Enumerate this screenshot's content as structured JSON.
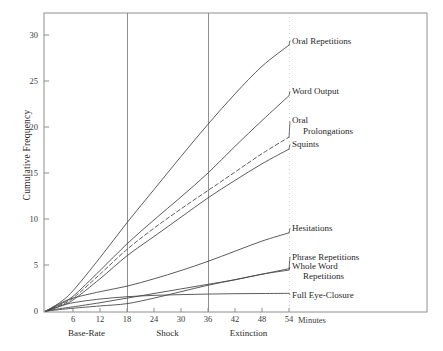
{
  "chart_data": {
    "type": "line",
    "title": "",
    "xlabel": "Minutes",
    "ylabel": "Cumulative Frequency",
    "xlim": [
      0,
      58
    ],
    "ylim": [
      0,
      32
    ],
    "xticks": [
      0,
      6,
      12,
      18,
      24,
      30,
      36,
      42,
      48,
      54
    ],
    "yticks": [
      0,
      5,
      10,
      15,
      20,
      25,
      30
    ],
    "grid": false,
    "vertical_dividers": [
      18,
      36
    ],
    "legend_position": "right-inline-labels",
    "phases": [
      {
        "label": "Base-Rate",
        "start": 0,
        "end": 18,
        "center": 9
      },
      {
        "label": "Shock",
        "start": 18,
        "end": 36,
        "center": 27
      },
      {
        "label": "Extinction",
        "start": 36,
        "end": 54,
        "center": 45
      }
    ],
    "x": [
      0,
      3,
      6,
      12,
      18,
      24,
      30,
      36,
      42,
      48,
      54
    ],
    "series": [
      {
        "name": "Oral Repetitions",
        "style": "solid",
        "values": [
          0,
          0.9,
          2.2,
          5.8,
          9.6,
          13.2,
          16.8,
          20.3,
          23.6,
          26.6,
          28.9
        ],
        "label_y": 29.4
      },
      {
        "name": "Word Output",
        "style": "solid",
        "values": [
          0,
          0.7,
          1.6,
          4.4,
          7.3,
          9.9,
          12.4,
          15.0,
          17.9,
          20.7,
          23.4
        ],
        "label_y": 23.9
      },
      {
        "name": "Oral Prolongations",
        "style": "dashed",
        "values": [
          0,
          0.6,
          1.4,
          4.0,
          6.7,
          9.0,
          11.1,
          13.1,
          15.1,
          17.1,
          18.9
        ],
        "label_y": 20.6
      },
      {
        "name": "Squints",
        "style": "solid",
        "values": [
          0,
          0.5,
          1.2,
          3.5,
          6.0,
          8.1,
          10.2,
          12.3,
          14.2,
          16.0,
          17.6
        ],
        "label_y": 18.1
      },
      {
        "name": "Hesitations",
        "style": "solid",
        "values": [
          0,
          0.8,
          1.4,
          2.1,
          2.7,
          3.5,
          4.4,
          5.4,
          6.5,
          7.6,
          8.5
        ],
        "label_y": 9.0
      },
      {
        "name": "Phrase Repetitions",
        "style": "solid",
        "values": [
          0,
          0.25,
          0.45,
          0.9,
          1.4,
          1.9,
          2.4,
          2.9,
          3.4,
          4.0,
          4.6
        ],
        "label_y": 5.9
      },
      {
        "name": "Whole Word Repetitions",
        "style": "solid",
        "values": [
          0,
          0.15,
          0.3,
          0.55,
          0.8,
          1.4,
          2.1,
          2.8,
          3.4,
          4.0,
          4.45
        ],
        "label_y": 4.8
      },
      {
        "name": "Full Eye-Closure",
        "style": "solid",
        "values": [
          0,
          0.5,
          0.9,
          1.3,
          1.55,
          1.7,
          1.78,
          1.84,
          1.88,
          1.9,
          1.92
        ],
        "label_y": 1.75
      }
    ],
    "series_labels_multiline": {
      "Oral Prolongations": [
        "Oral",
        "Prolongations"
      ],
      "Whole Word Repetitions": [
        "Whole Word",
        "Repetitions"
      ]
    }
  },
  "axis": {
    "y_title": "Cumulative Frequency",
    "x_unit_label": "Minutes",
    "y_tick_labels": [
      "0",
      "5",
      "10",
      "15",
      "20",
      "25",
      "30"
    ],
    "x_tick_labels": [
      "6",
      "12",
      "18",
      "24",
      "30",
      "36",
      "42",
      "48",
      "54"
    ],
    "origin_label": "0"
  },
  "phase_labels": {
    "base_rate": "Base-Rate",
    "shock": "Shock",
    "extinction": "Extinction"
  },
  "series_labels": {
    "oral_repetitions": "Oral Repetitions",
    "word_output": "Word Output",
    "oral": "Oral",
    "prolongations": "Prolongations",
    "squints": "Squints",
    "hesitations": "Hesitations",
    "phrase_repetitions": "Phrase Repetitions",
    "whole_word": "Whole Word",
    "repetitions": "Repetitions",
    "full_eye_closure": "Full Eye-Closure"
  },
  "colors": {
    "line": "#4a4a4a",
    "frame": "#8e8e8e",
    "divider": "#8e8e8e",
    "text": "#2b2b2b",
    "background": "#ffffff"
  }
}
